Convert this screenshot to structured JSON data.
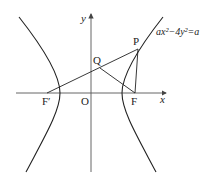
{
  "diagram": {
    "type": "hyperbola-geometry",
    "equation_label": "ax²−4y²=a",
    "axes": {
      "x_label": "x",
      "y_label": "y",
      "origin_label": "O"
    },
    "points": [
      {
        "name": "P",
        "label": "P"
      },
      {
        "name": "Q",
        "label": "Q"
      },
      {
        "name": "F",
        "label": "F"
      },
      {
        "name": "F-prime",
        "label": "F′"
      }
    ],
    "segments": [
      "F′P",
      "QF",
      "PF"
    ],
    "colors": {
      "stroke": "#222222",
      "axis": "#555555",
      "background": "#ffffff"
    }
  }
}
